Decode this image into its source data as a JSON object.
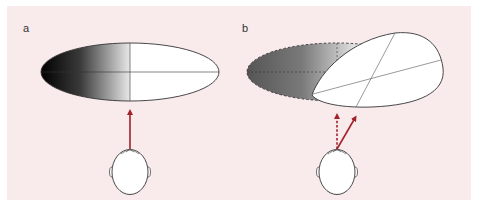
{
  "figure": {
    "panels": [
      {
        "id": "a",
        "label": "a",
        "description": "Head facing straight ahead; gradient ellipse with dark left half, white right half"
      },
      {
        "id": "b",
        "label": "b",
        "description": "Head turned right; original dashed gradient ellipse and rotated white egg-shaped field"
      }
    ],
    "colors": {
      "background": "#f9ebec",
      "arrow": "#a3212a",
      "outline": "#333333",
      "fill": "#ffffff",
      "gradient_dark": "#000000",
      "gradient_dark_b": "#555555"
    }
  }
}
